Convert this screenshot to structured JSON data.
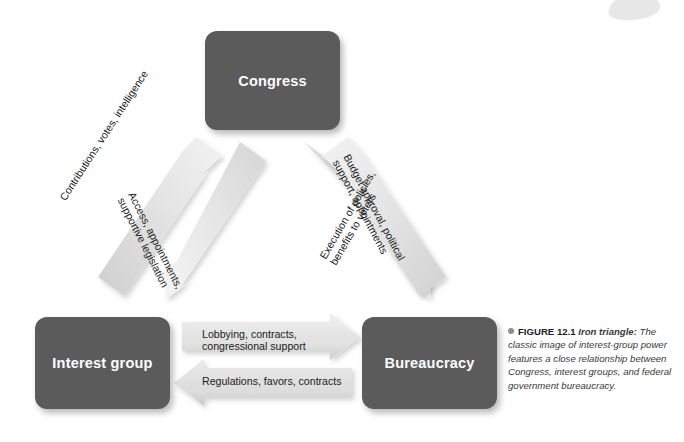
{
  "figure": {
    "bullet_icon": "bullet-dot",
    "number_label": "FIGURE 12.1",
    "title": "Iron triangle:",
    "caption": "The classic image of interest-group power features a close relationship between Congress, interest groups, and federal government bureaucracy."
  },
  "colors": {
    "node_fill": "#5b5b5b",
    "node_text": "#ffffff",
    "arrow_fill": "#e6e6e6",
    "arrow_fill_dark": "#d2d2d2",
    "label_text": "#1a1a1a",
    "caption_text": "#3a3a3a",
    "background": "#ffffff"
  },
  "diagram": {
    "type": "iron-triangle",
    "nodes": [
      {
        "id": "congress",
        "label": "Congress"
      },
      {
        "id": "interest_group",
        "label": "Interest group"
      },
      {
        "id": "bureaucracy",
        "label": "Bureaucracy"
      }
    ],
    "arrows": [
      {
        "id": "interest-to-congress",
        "from": "interest_group",
        "to": "congress",
        "direction": "up-right",
        "label_line1": "Contributions, votes, intelligence",
        "label_line2": ""
      },
      {
        "id": "congress-to-interest",
        "from": "congress",
        "to": "interest_group",
        "direction": "down-left",
        "label_line1": "Access, appointments,",
        "label_line2": "supportive legislation"
      },
      {
        "id": "congress-to-bureaucracy",
        "from": "congress",
        "to": "bureaucracy",
        "direction": "down-right",
        "label_line1": "Budget approval, political",
        "label_line2": "support, appointments"
      },
      {
        "id": "bureaucracy-to-congress",
        "from": "bureaucracy",
        "to": "congress",
        "direction": "up-left",
        "label_line1": "Execution of policies,",
        "label_line2": "benefits to voters"
      },
      {
        "id": "interest-to-bureaucracy",
        "from": "interest_group",
        "to": "bureaucracy",
        "direction": "right",
        "label_line1": "Lobbying, contracts,",
        "label_line2": "congressional support"
      },
      {
        "id": "bureaucracy-to-interest",
        "from": "bureaucracy",
        "to": "interest_group",
        "direction": "left",
        "label_line1": "Regulations, favors, contracts",
        "label_line2": ""
      }
    ]
  }
}
